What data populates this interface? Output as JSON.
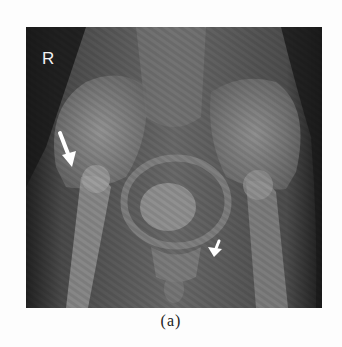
{
  "figure": {
    "side_marker": "R",
    "caption": "(a)",
    "annotations": [
      {
        "type": "arrow",
        "name": "large-arrow",
        "location": "right hip / femoral neck",
        "color": "#ffffff"
      },
      {
        "type": "arrow",
        "name": "small-arrow",
        "location": "left pubic region",
        "color": "#ffffff"
      }
    ]
  }
}
